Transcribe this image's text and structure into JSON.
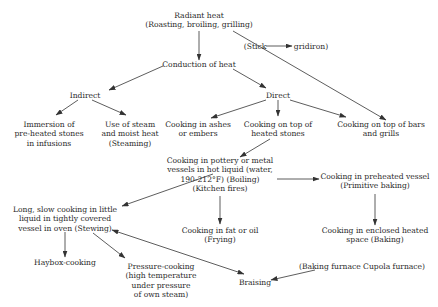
{
  "diagram": {
    "type": "flowchart",
    "nodes": {
      "radiant": {
        "label": "Radiant heat\n(Roasting, broiling, grilling)"
      },
      "stick": {
        "label": "(Stick"
      },
      "gridiron": {
        "label": "gridiron)"
      },
      "conduction": {
        "label": "Conduction of heat"
      },
      "indirect": {
        "label": "Indirect"
      },
      "direct": {
        "label": "Direct"
      },
      "immersion": {
        "label": "Immersion of\npre-heated stones\nin infusions"
      },
      "steaming": {
        "label": "Use of steam\nand moist heat\n(Steaming)"
      },
      "ashes": {
        "label": "Cooking in ashes\nor embers"
      },
      "stones": {
        "label": "Cooking on top of\nheated stones"
      },
      "bars": {
        "label": "Cooking on top of bars\nand grills"
      },
      "boiling": {
        "label": "Cooking in pottery or metal\nvessels in hot liquid (water,\n190-212°F) (Boiling)\n(Kitchen fires)"
      },
      "primitive_baking": {
        "label": "Cooking in preheated vessel\n(Primitive baking)"
      },
      "stewing": {
        "label": "Long, slow cooking in little\nliquid in tightly covered\nvessel in oven (Stewing)"
      },
      "frying": {
        "label": "Cooking in fat or oil\n(Frying)"
      },
      "baking": {
        "label": "Cooking in enclosed heated\nspace (Baking)"
      },
      "haybox": {
        "label": "Haybox-cooking"
      },
      "pressure": {
        "label": "Pressure-cooking\n(high temperature\nunder pressure\nof own steam)"
      },
      "braising": {
        "label": "Braising"
      },
      "furnace": {
        "label": "(Baking furnace Cupola furnace)"
      }
    },
    "edges": [
      {
        "from": "radiant",
        "to": "conduction"
      },
      {
        "from": "radiant",
        "to": "bars"
      },
      {
        "from": "stick",
        "to": "gridiron"
      },
      {
        "from": "conduction",
        "to": "indirect"
      },
      {
        "from": "conduction",
        "to": "direct"
      },
      {
        "from": "indirect",
        "to": "immersion"
      },
      {
        "from": "indirect",
        "to": "steaming"
      },
      {
        "from": "direct",
        "to": "ashes"
      },
      {
        "from": "direct",
        "to": "stones"
      },
      {
        "from": "direct",
        "to": "bars"
      },
      {
        "from": "stones",
        "to": "boiling"
      },
      {
        "from": "boiling",
        "to": "primitive_baking"
      },
      {
        "from": "boiling",
        "to": "stewing"
      },
      {
        "from": "boiling",
        "to": "frying"
      },
      {
        "from": "primitive_baking",
        "to": "baking"
      },
      {
        "from": "stewing",
        "to": "haybox"
      },
      {
        "from": "stewing",
        "to": "pressure"
      },
      {
        "from": "stewing",
        "to": "braising",
        "bidirectional": true
      },
      {
        "from": "furnace",
        "to": "braising"
      }
    ]
  }
}
